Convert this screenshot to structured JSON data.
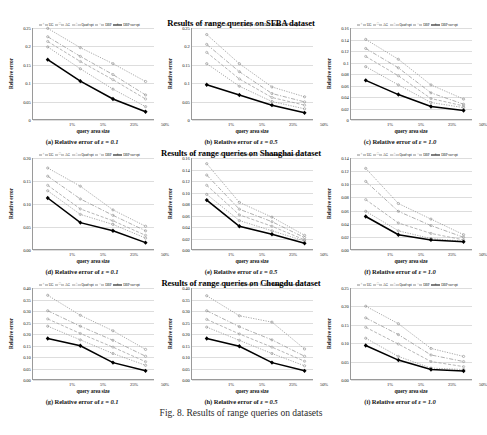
{
  "figure": {
    "caption": "Fig. 8.  Results of range queries on datasets",
    "group_titles": [
      "Results of range queries on SFBA dataset",
      "Results of range queries on Shanghai dataset",
      "Results of range queries on Chengdu dataset"
    ]
  },
  "series_style": {
    "names": [
      "UG",
      "AG",
      "Quad-opt",
      "DBP",
      "DBP-our-opt"
    ],
    "colors": [
      "#8a8a8a",
      "#8f8f8f",
      "#9a9a9a",
      "#8a8a8a",
      "#000000"
    ],
    "dashes": [
      "1.2 1.2",
      "4 1.5 1.2 1.5",
      "3 1.6",
      "1.2 1.2",
      "none"
    ],
    "markers": [
      "×",
      "□",
      "△",
      "○",
      "⬩"
    ],
    "widths": [
      0.7,
      0.7,
      0.7,
      0.7,
      1.5
    ]
  },
  "chart_data": [
    {
      "type": "line",
      "panel": "a",
      "caption_prefix": "(a) Relative error of",
      "caption_eps": "ε = 0.1",
      "title": "Results of range queries on SFBA dataset",
      "xlabel": "query area size",
      "ylabel": "Relative error",
      "categories": [
        "1%",
        "5%",
        "25%",
        "50%"
      ],
      "ylim": [
        0,
        0.25
      ],
      "yticks": [
        0,
        0.05,
        0.1,
        0.15,
        0.2,
        0.25
      ],
      "ytick_labels": [
        "0",
        "0.05",
        "0.1",
        "0.15",
        "0.2",
        "0.25"
      ],
      "grid": true,
      "legend": "top",
      "series": [
        {
          "name": "UG",
          "values": [
            0.249,
            0.196,
            0.152,
            0.103
          ]
        },
        {
          "name": "AG",
          "values": [
            0.226,
            0.172,
            0.122,
            0.066
          ]
        },
        {
          "name": "Quad-opt",
          "values": [
            0.213,
            0.158,
            0.108,
            0.055
          ]
        },
        {
          "name": "DBP",
          "values": [
            0.198,
            0.138,
            0.082,
            0.034
          ]
        },
        {
          "name": "DBP-our-opt",
          "values": [
            0.163,
            0.104,
            0.055,
            0.02
          ]
        }
      ]
    },
    {
      "type": "line",
      "panel": "b",
      "caption_prefix": "(b) Relative error of",
      "caption_eps": "ε = 0.5",
      "title": "Results of range queries on SFBA dataset",
      "xlabel": "query area size",
      "ylabel": "Relative error",
      "categories": [
        "1%",
        "5%",
        "25%",
        "50%"
      ],
      "ylim": [
        0,
        0.25
      ],
      "yticks": [
        0,
        0.05,
        0.1,
        0.15,
        0.2,
        0.25
      ],
      "ytick_labels": [
        "0",
        "0.05",
        "0.1",
        "0.15",
        "0.2",
        "0.25"
      ],
      "grid": true,
      "legend": "top",
      "series": [
        {
          "name": "UG",
          "values": [
            0.232,
            0.152,
            0.088,
            0.061
          ]
        },
        {
          "name": "AG",
          "values": [
            0.205,
            0.13,
            0.07,
            0.047
          ]
        },
        {
          "name": "Quad-opt",
          "values": [
            0.183,
            0.11,
            0.059,
            0.038
          ]
        },
        {
          "name": "DBP",
          "values": [
            0.152,
            0.09,
            0.048,
            0.028
          ]
        },
        {
          "name": "DBP-our-opt",
          "values": [
            0.094,
            0.066,
            0.038,
            0.017
          ]
        }
      ]
    },
    {
      "type": "line",
      "panel": "c",
      "caption_prefix": "(c) Relative error of",
      "caption_eps": "ε = 1.0",
      "title": "Results of range queries on SFBA dataset",
      "xlabel": "query area size",
      "ylabel": "Relative error",
      "categories": [
        "1%",
        "5%",
        "25%",
        "50%"
      ],
      "ylim": [
        0,
        0.16
      ],
      "yticks": [
        0,
        0.02,
        0.04,
        0.06,
        0.08,
        0.1,
        0.12,
        0.14,
        0.16
      ],
      "ytick_labels": [
        "0",
        "0.02",
        "0.04",
        "0.06",
        "0.08",
        "0.1",
        "0.12",
        "0.14",
        "0.16"
      ],
      "grid": true,
      "legend": "top",
      "series": [
        {
          "name": "UG",
          "values": [
            0.14,
            0.105,
            0.06,
            0.035
          ]
        },
        {
          "name": "AG",
          "values": [
            0.124,
            0.09,
            0.046,
            0.026
          ]
        },
        {
          "name": "Quad-opt",
          "values": [
            0.11,
            0.076,
            0.036,
            0.023
          ]
        },
        {
          "name": "DBP",
          "values": [
            0.092,
            0.06,
            0.029,
            0.02
          ]
        },
        {
          "name": "DBP-our-opt",
          "values": [
            0.068,
            0.043,
            0.022,
            0.015
          ]
        }
      ]
    },
    {
      "type": "line",
      "panel": "d",
      "caption_prefix": "(d) Relative error of",
      "caption_eps": "ε = 0.1",
      "title": "Results of range queries on Shanghai dataset",
      "xlabel": "query area size",
      "ylabel": "Relative error",
      "categories": [
        "1%",
        "5%",
        "25%",
        "50%"
      ],
      "ylim": [
        0,
        0.2
      ],
      "yticks": [
        0,
        0.05,
        0.1,
        0.15,
        0.2
      ],
      "ytick_labels": [
        "0.00",
        "0.05",
        "0.10",
        "0.15",
        "0.20"
      ],
      "grid": true,
      "legend": "top",
      "series": [
        {
          "name": "UG",
          "values": [
            0.178,
            0.138,
            0.086,
            0.05
          ]
        },
        {
          "name": "AG",
          "values": [
            0.16,
            0.11,
            0.074,
            0.04
          ]
        },
        {
          "name": "Quad-opt",
          "values": [
            0.14,
            0.088,
            0.062,
            0.03
          ]
        },
        {
          "name": "DBP",
          "values": [
            0.128,
            0.076,
            0.054,
            0.024
          ]
        },
        {
          "name": "DBP-our-opt",
          "values": [
            0.112,
            0.058,
            0.04,
            0.014
          ]
        }
      ]
    },
    {
      "type": "line",
      "panel": "e",
      "caption_prefix": "(e) Relative error of",
      "caption_eps": "ε = 0.5",
      "title": "Results of range queries on Shanghai dataset",
      "xlabel": "query area size",
      "ylabel": "Relative error",
      "categories": [
        "1%",
        "5%",
        "25%",
        "50%"
      ],
      "ylim": [
        0,
        0.16
      ],
      "yticks": [
        0,
        0.02,
        0.04,
        0.06,
        0.08,
        0.1,
        0.12,
        0.14,
        0.16
      ],
      "ytick_labels": [
        "0.00",
        "0.02",
        "0.04",
        "0.06",
        "0.08",
        "0.10",
        "0.12",
        "0.14",
        "0.16"
      ],
      "grid": true,
      "legend": "top",
      "series": [
        {
          "name": "UG",
          "values": [
            0.15,
            0.082,
            0.056,
            0.024
          ]
        },
        {
          "name": "AG",
          "values": [
            0.13,
            0.07,
            0.048,
            0.02
          ]
        },
        {
          "name": "Quad-opt",
          "values": [
            0.112,
            0.06,
            0.04,
            0.016
          ]
        },
        {
          "name": "DBP",
          "values": [
            0.096,
            0.05,
            0.032,
            0.014
          ]
        },
        {
          "name": "DBP-our-opt",
          "values": [
            0.086,
            0.04,
            0.026,
            0.01
          ]
        }
      ]
    },
    {
      "type": "line",
      "panel": "f",
      "caption_prefix": "(f) Relative error of",
      "caption_eps": "ε = 1.0",
      "title": "Results of range queries on Shanghai dataset",
      "xlabel": "query area size",
      "ylabel": "Relative error",
      "categories": [
        "1%",
        "5%",
        "25%",
        "50%"
      ],
      "ylim": [
        0,
        0.14
      ],
      "yticks": [
        0,
        0.02,
        0.04,
        0.06,
        0.08,
        0.1,
        0.12,
        0.14
      ],
      "ytick_labels": [
        "0.00",
        "0.02",
        "0.04",
        "0.06",
        "0.08",
        "0.10",
        "0.12",
        "0.14"
      ],
      "grid": true,
      "legend": "top",
      "series": [
        {
          "name": "UG",
          "values": [
            0.124,
            0.07,
            0.046,
            0.022
          ]
        },
        {
          "name": "AG",
          "values": [
            0.104,
            0.058,
            0.036,
            0.018
          ]
        },
        {
          "name": "Quad-opt",
          "values": [
            0.076,
            0.04,
            0.024,
            0.014
          ]
        },
        {
          "name": "DBP",
          "values": [
            0.058,
            0.028,
            0.016,
            0.012
          ]
        },
        {
          "name": "DBP-our-opt",
          "values": [
            0.05,
            0.022,
            0.014,
            0.011
          ]
        }
      ]
    },
    {
      "type": "line",
      "panel": "g",
      "caption_prefix": "(g) Relative error of",
      "caption_eps": "ε = 0.1",
      "title": "Results of range queries on Chengdu dataset",
      "xlabel": "query area size",
      "ylabel": "Relative error",
      "categories": [
        "1%",
        "5%",
        "25%",
        "50%"
      ],
      "ylim": [
        0,
        0.4
      ],
      "yticks": [
        0,
        0.05,
        0.1,
        0.15,
        0.2,
        0.25,
        0.3,
        0.35,
        0.4
      ],
      "ytick_labels": [
        "0.00",
        "0.05",
        "0.10",
        "0.15",
        "0.20",
        "0.25",
        "0.30",
        "0.35",
        "0.40"
      ],
      "grid": true,
      "legend": "top",
      "series": [
        {
          "name": "UG",
          "values": [
            0.368,
            0.28,
            0.212,
            0.13
          ]
        },
        {
          "name": "AG",
          "values": [
            0.3,
            0.232,
            0.17,
            0.1
          ]
        },
        {
          "name": "Quad-opt",
          "values": [
            0.264,
            0.2,
            0.14,
            0.076
          ]
        },
        {
          "name": "DBP",
          "values": [
            0.232,
            0.172,
            0.112,
            0.06
          ]
        },
        {
          "name": "DBP-our-opt",
          "values": [
            0.178,
            0.146,
            0.072,
            0.036
          ]
        }
      ]
    },
    {
      "type": "line",
      "panel": "h",
      "caption_prefix": "(h) Relative error of",
      "caption_eps": "ε = 0.5",
      "title": "Results of range queries on Chengdu dataset",
      "xlabel": "query area size",
      "ylabel": "Relative error",
      "categories": [
        "1%",
        "5%",
        "25%",
        "50%"
      ],
      "ylim": [
        0,
        0.4
      ],
      "yticks": [
        0,
        0.05,
        0.1,
        0.15,
        0.2,
        0.25,
        0.3,
        0.35,
        0.4
      ],
      "ytick_labels": [
        "0.00",
        "0.05",
        "0.10",
        "0.15",
        "0.20",
        "0.25",
        "0.30",
        "0.35",
        "0.40"
      ],
      "grid": true,
      "legend": "top",
      "series": [
        {
          "name": "UG",
          "values": [
            0.366,
            0.278,
            0.25,
            0.132
          ]
        },
        {
          "name": "AG",
          "values": [
            0.3,
            0.23,
            0.172,
            0.1
          ]
        },
        {
          "name": "Quad-opt",
          "values": [
            0.262,
            0.198,
            0.14,
            0.078
          ]
        },
        {
          "name": "DBP",
          "values": [
            0.228,
            0.17,
            0.112,
            0.058
          ]
        },
        {
          "name": "DBP-our-opt",
          "values": [
            0.178,
            0.144,
            0.072,
            0.036
          ]
        }
      ]
    },
    {
      "type": "line",
      "panel": "i",
      "caption_prefix": "(i) Relative error of",
      "caption_eps": "ε = 1.0",
      "title": "Results of range queries on Chengdu dataset",
      "xlabel": "query area size",
      "ylabel": "Relative error",
      "categories": [
        "1%",
        "5%",
        "25%",
        "50%"
      ],
      "ylim": [
        0,
        0.25
      ],
      "yticks": [
        0,
        0.05,
        0.1,
        0.15,
        0.2,
        0.25
      ],
      "ytick_labels": [
        "0.00",
        "0.05",
        "0.10",
        "0.15",
        "0.20",
        "0.25"
      ],
      "grid": true,
      "legend": "top",
      "series": [
        {
          "name": "UG",
          "values": [
            0.2,
            0.152,
            0.084,
            0.062
          ]
        },
        {
          "name": "AG",
          "values": [
            0.168,
            0.122,
            0.066,
            0.048
          ]
        },
        {
          "name": "Quad-opt",
          "values": [
            0.142,
            0.096,
            0.048,
            0.034
          ]
        },
        {
          "name": "DBP",
          "values": [
            0.112,
            0.062,
            0.03,
            0.026
          ]
        },
        {
          "name": "DBP-our-opt",
          "values": [
            0.092,
            0.052,
            0.026,
            0.022
          ]
        }
      ]
    }
  ]
}
